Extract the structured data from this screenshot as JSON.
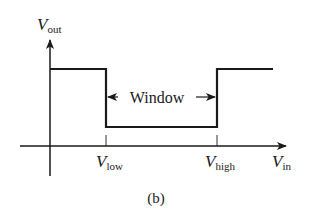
{
  "diagram": {
    "caption": "(b)",
    "y_axis": {
      "symbol": "V",
      "subscript": "out"
    },
    "x_axis": {
      "symbol": "V",
      "subscript": "in"
    },
    "thresholds": [
      {
        "symbol": "V",
        "subscript": "low"
      },
      {
        "symbol": "V",
        "subscript": "high"
      }
    ],
    "window_label": "Window",
    "waveform": {
      "description": "Window comparator transfer characteristic: output high below V_low, low between V_low and V_high, high above V_high",
      "levels": [
        "high",
        "low",
        "high"
      ]
    },
    "colors": {
      "ink": "#1a1a1a",
      "background": "#ffffff"
    }
  }
}
